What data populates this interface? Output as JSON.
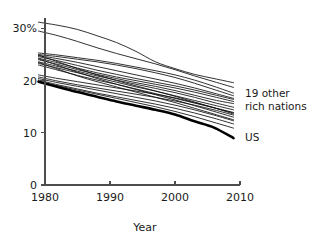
{
  "chart_data": {
    "type": "line",
    "title": "",
    "xlabel": "Year",
    "ylabel": "",
    "xlim": [
      1979,
      2009
    ],
    "ylim": [
      0,
      32
    ],
    "grid": false,
    "legend_position": "right-inline-annotations",
    "x_ticks": [
      1980,
      1990,
      2000,
      2010
    ],
    "x_tick_labels": [
      "1980",
      "1990",
      "2000",
      "2010"
    ],
    "y_ticks": [
      0,
      10,
      20,
      30
    ],
    "y_tick_labels": [
      "0",
      "10",
      "20",
      "30%"
    ],
    "annotations": [
      {
        "id": "other-nations",
        "text_line1": "19 other",
        "text_line2": "rich nations",
        "x": 2010.5,
        "y": 16.0
      },
      {
        "id": "us",
        "text": "US",
        "x": 2010.5,
        "y": 9.0
      }
    ],
    "x": [
      1979,
      1982,
      1985,
      1988,
      1991,
      1994,
      1997,
      2000,
      2003,
      2006,
      2009
    ],
    "series": [
      {
        "name": "nation-01",
        "highlight": false,
        "values": [
          31.2,
          30.6,
          29.8,
          28.6,
          27.3,
          25.6,
          23.6,
          22.3,
          21.2,
          20.4,
          19.6
        ]
      },
      {
        "name": "nation-02",
        "highlight": false,
        "values": [
          29.5,
          28.6,
          27.5,
          26.3,
          25.2,
          24.2,
          23.2,
          22.1,
          20.9,
          19.8,
          18.7
        ]
      },
      {
        "name": "nation-03",
        "highlight": false,
        "values": [
          25.3,
          24.9,
          24.4,
          23.9,
          23.3,
          22.6,
          21.9,
          21.1,
          20.1,
          18.9,
          17.6
        ]
      },
      {
        "name": "nation-04",
        "highlight": false,
        "values": [
          25.0,
          24.6,
          24.1,
          23.6,
          23.0,
          22.3,
          21.5,
          20.6,
          19.5,
          18.3,
          17.1
        ]
      },
      {
        "name": "nation-05",
        "highlight": false,
        "values": [
          24.8,
          24.2,
          23.5,
          22.7,
          21.9,
          21.1,
          20.3,
          19.5,
          18.6,
          17.6,
          16.6
        ]
      },
      {
        "name": "nation-06",
        "highlight": false,
        "values": [
          24.6,
          23.8,
          22.9,
          22.0,
          21.2,
          20.4,
          19.7,
          19.0,
          18.2,
          17.3,
          16.4
        ]
      },
      {
        "name": "nation-07",
        "highlight": false,
        "values": [
          24.3,
          23.4,
          22.4,
          21.5,
          20.7,
          20.0,
          19.3,
          18.6,
          17.8,
          16.9,
          16.0
        ]
      },
      {
        "name": "nation-08",
        "highlight": false,
        "values": [
          24.0,
          23.1,
          22.1,
          21.2,
          20.4,
          19.6,
          18.9,
          18.1,
          17.2,
          16.3,
          15.6
        ]
      },
      {
        "name": "nation-09",
        "highlight": false,
        "values": [
          23.6,
          22.7,
          21.8,
          20.9,
          20.1,
          19.3,
          18.5,
          17.7,
          16.8,
          15.8,
          14.9
        ]
      },
      {
        "name": "nation-10",
        "highlight": false,
        "values": [
          23.3,
          22.4,
          21.5,
          20.6,
          19.7,
          18.8,
          18.0,
          17.1,
          16.2,
          15.3,
          14.4
        ]
      },
      {
        "name": "nation-11",
        "highlight": false,
        "values": [
          23.0,
          22.0,
          21.0,
          20.1,
          19.3,
          18.4,
          17.5,
          16.6,
          15.7,
          14.8,
          13.9
        ]
      },
      {
        "name": "nation-12",
        "highlight": false,
        "values": [
          24.9,
          23.6,
          22.3,
          21.1,
          20.0,
          19.0,
          18.0,
          17.0,
          15.9,
          14.8,
          13.6
        ]
      },
      {
        "name": "nation-13",
        "highlight": false,
        "values": [
          24.2,
          22.9,
          21.6,
          20.4,
          19.3,
          18.3,
          17.3,
          16.3,
          15.2,
          14.1,
          13.0
        ]
      },
      {
        "name": "nation-14",
        "highlight": false,
        "values": [
          23.5,
          22.2,
          20.9,
          19.8,
          18.8,
          17.8,
          16.8,
          15.8,
          14.7,
          13.6,
          12.5
        ]
      },
      {
        "name": "nation-15",
        "highlight": false,
        "values": [
          21.1,
          20.4,
          19.8,
          19.2,
          18.6,
          18.0,
          17.4,
          16.7,
          15.8,
          14.8,
          13.8
        ]
      },
      {
        "name": "nation-16",
        "highlight": false,
        "values": [
          20.7,
          19.9,
          19.2,
          18.6,
          18.0,
          17.4,
          16.8,
          16.1,
          15.3,
          14.4,
          13.4
        ]
      },
      {
        "name": "nation-17",
        "highlight": false,
        "values": [
          20.4,
          19.6,
          18.9,
          18.2,
          17.5,
          16.8,
          16.1,
          15.3,
          14.4,
          13.4,
          12.3
        ]
      },
      {
        "name": "nation-18",
        "highlight": false,
        "values": [
          20.1,
          19.2,
          18.4,
          17.6,
          16.9,
          16.2,
          15.5,
          14.7,
          13.8,
          12.8,
          11.7
        ]
      },
      {
        "name": "nation-19",
        "highlight": false,
        "values": [
          19.8,
          19.0,
          18.2,
          17.4,
          16.6,
          15.8,
          15.0,
          14.1,
          13.1,
          12.0,
          10.9
        ]
      },
      {
        "name": "US",
        "highlight": true,
        "values": [
          19.8,
          18.8,
          17.8,
          16.9,
          16.0,
          15.2,
          14.4,
          13.5,
          12.2,
          11.0,
          9.0
        ]
      }
    ]
  }
}
